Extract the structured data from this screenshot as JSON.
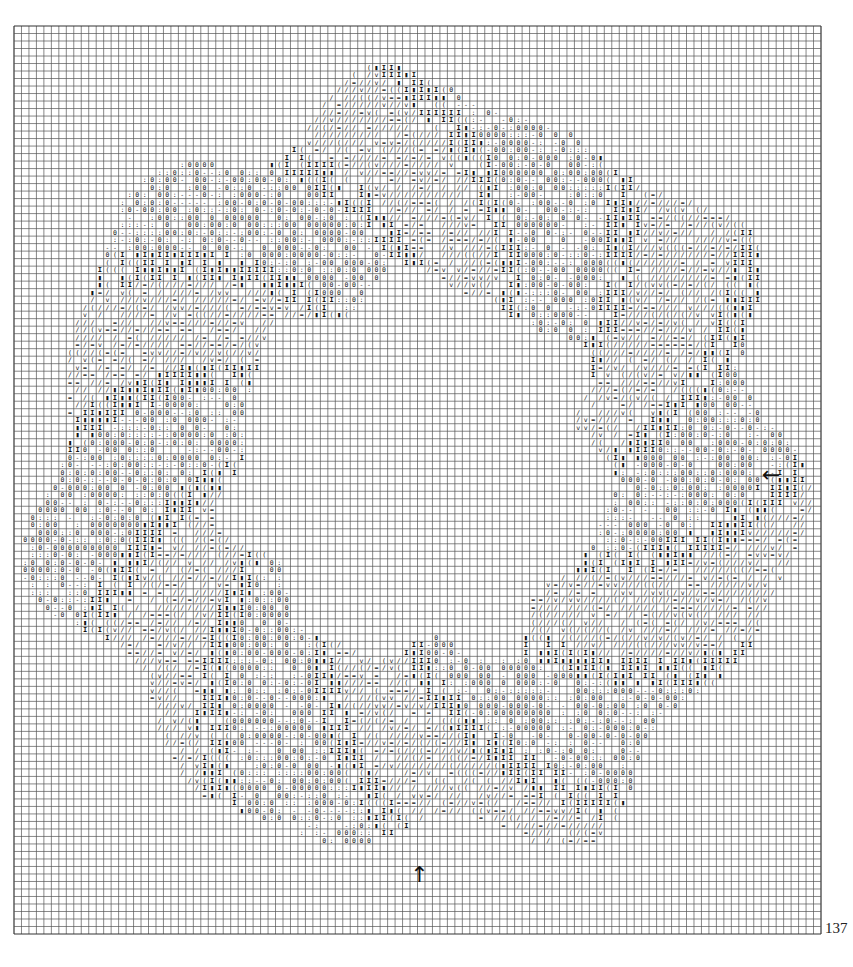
{
  "chart_data": {
    "type": "heatmap",
    "title": "",
    "grid": {
      "columns": 108,
      "rows": 121
    },
    "symbol_legend": [
      {
        "symbol": "I",
        "meaning": "dark bold stitch (hourglass)"
      },
      {
        "symbol": "▮",
        "meaning": "filled dark stitch"
      },
      {
        "symbol": "(",
        "meaning": "left-bracket stitch"
      },
      {
        "symbol": "/",
        "meaning": "slash stitch"
      },
      {
        "symbol": "=",
        "meaning": "double-bar stitch"
      },
      {
        "symbol": "v",
        "meaning": "v stitch"
      },
      {
        "symbol": ":",
        "meaning": "colon stitch"
      },
      {
        "symbol": "0",
        "meaning": "circle stitch"
      },
      {
        "symbol": "-",
        "meaning": "dash stitch"
      }
    ],
    "center_markers": [
      {
        "name": "center-arrow-right",
        "glyph": "←",
        "side": "right",
        "row": 60
      },
      {
        "name": "center-arrow-bottom",
        "glyph": "↑",
        "side": "bottom",
        "column": 54
      }
    ],
    "motif": {
      "shape": "ring",
      "ring_outer_radius_cells": 50,
      "ring_inner_radius_cells": 25
    }
  },
  "page": {
    "number": "137"
  }
}
